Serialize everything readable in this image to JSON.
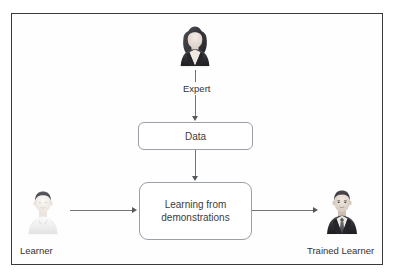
{
  "diagram_data": {
    "type": "diagram",
    "title": "Learning from demonstrations pipeline",
    "layout": "top-down with lateral inputs and outputs",
    "nodes": [
      {
        "id": "expert",
        "label": "Expert",
        "kind": "actor-photo",
        "icon": "businesswoman-avatar-icon",
        "position": "top-center"
      },
      {
        "id": "data",
        "label": "Data",
        "kind": "process-box",
        "position": "center-upper"
      },
      {
        "id": "lfd",
        "label": "Learning from\ndemonstrations",
        "kind": "process-box",
        "position": "center-lower"
      },
      {
        "id": "learner",
        "label": "Learner",
        "kind": "actor-photo",
        "icon": "faded-person-avatar-icon",
        "position": "bottom-left"
      },
      {
        "id": "trained",
        "label": "Trained Learner",
        "kind": "actor-photo",
        "icon": "businessman-avatar-icon",
        "position": "bottom-right"
      }
    ],
    "edges": [
      {
        "from": "expert",
        "to": "data",
        "label": "",
        "direction": "down",
        "style": "solid-arrow"
      },
      {
        "from": "data",
        "to": "lfd",
        "label": "",
        "direction": "down",
        "style": "solid-arrow"
      },
      {
        "from": "learner",
        "to": "lfd",
        "label": "",
        "direction": "right",
        "style": "solid-arrow"
      },
      {
        "from": "lfd",
        "to": "trained",
        "label": "",
        "direction": "right",
        "style": "solid-arrow"
      }
    ],
    "colors": {
      "frame_border": "#3a3a3c",
      "box_border": "#9aa0a6",
      "connector": "#6f7479",
      "arrowhead": "#56595c",
      "text": "#333336",
      "background": "#ffffff"
    }
  },
  "nodes": {
    "expert": {
      "label": "Expert"
    },
    "data": {
      "label": "Data"
    },
    "lfd": {
      "label": "Learning from\ndemonstrations"
    },
    "learner": {
      "label": "Learner"
    },
    "trained": {
      "label": "Trained Learner"
    }
  }
}
